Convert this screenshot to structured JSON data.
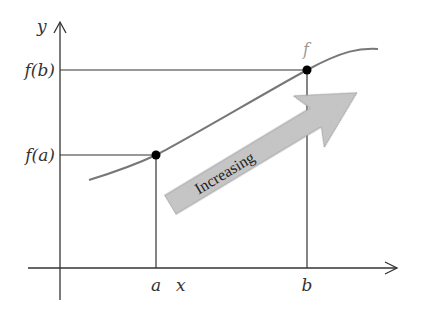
{
  "diagram": {
    "axes": {
      "x_label": "x",
      "y_label": "y"
    },
    "curve_label": "f",
    "points": [
      {
        "name": "point-a",
        "x_label": "a",
        "y_label": "f(a)"
      },
      {
        "name": "point-b",
        "x_label": "b",
        "y_label": "f(b)"
      }
    ],
    "arrow": {
      "label": "Increasing",
      "fill": "#c8c8c8"
    },
    "colors": {
      "axis": "#333333",
      "curve": "#777777",
      "guide": "#333333",
      "point": "#000000",
      "curve_label": "#999999"
    }
  }
}
